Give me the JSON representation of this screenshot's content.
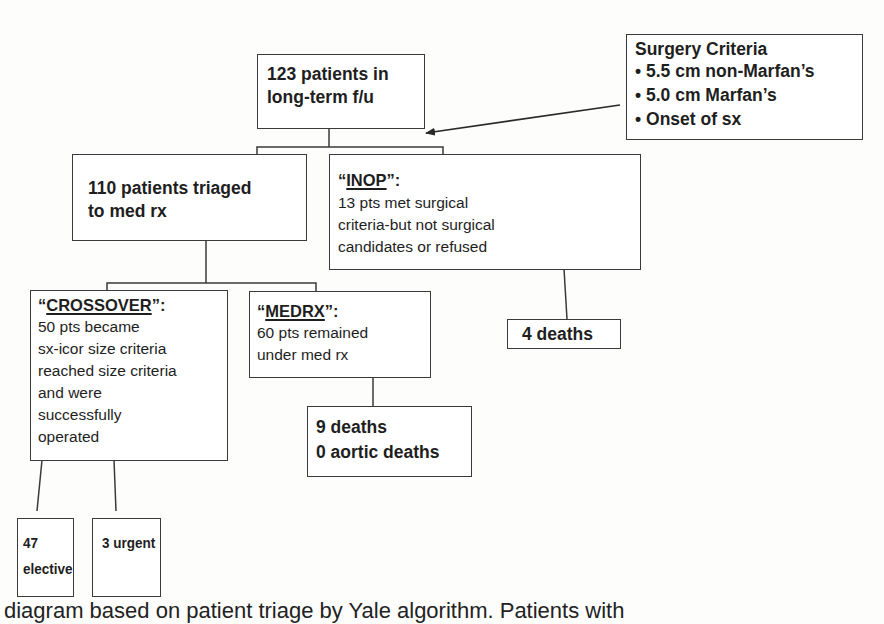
{
  "diagram": {
    "title_box": {
      "lines": [
        "123 patients in",
        "long-term f/u"
      ]
    },
    "criteria_box": {
      "heading": "Surgery Criteria",
      "items": [
        "5.5 cm non-Marfan’s",
        "5.0 cm Marfan’s",
        "Onset of sx"
      ],
      "bullet": "•"
    },
    "triaged_box": {
      "lines": [
        "110 patients triaged",
        "to med rx"
      ]
    },
    "inop_box": {
      "label": "INOP",
      "open_quote": "“",
      "close_quote": "”:",
      "lines": [
        "13 pts met surgical",
        "criteria-but not surgical",
        "candidates or refused"
      ]
    },
    "inop_outcome": {
      "label": "4 deaths"
    },
    "crossover_box": {
      "label": "CROSSOVER",
      "open_quote": "“",
      "close_quote": "”:",
      "lines": [
        "50 pts became",
        "sx-icor size criteria",
        "reached size criteria",
        "and were",
        "successfully",
        "operated"
      ]
    },
    "medrx_box": {
      "label": "MEDRX",
      "open_quote": "“",
      "close_quote": "”:",
      "lines": [
        "60 pts remained",
        "under med rx"
      ]
    },
    "medrx_outcome": {
      "lines": [
        "9 deaths",
        "0 aortic deaths"
      ]
    },
    "elective_box": {
      "lines": [
        "47",
        "elective"
      ]
    },
    "urgent_box": {
      "label": "3 urgent"
    }
  },
  "caption": "diagram based on patient triage by Yale algorithm. Patients with"
}
